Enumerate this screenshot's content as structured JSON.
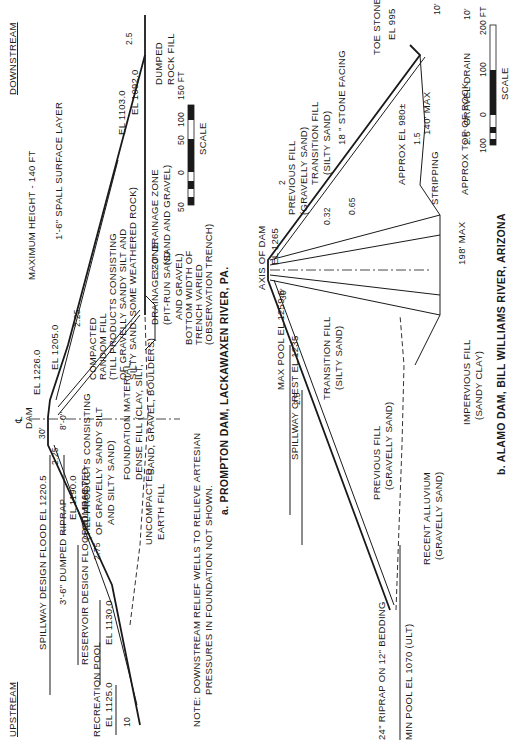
{
  "figure_a": {
    "caption": "a.  PROMPTON DAM, LACKAWAXEN RIVER, PA.",
    "upstream": "UPSTREAM",
    "downstream": "DOWNSTREAM",
    "max_height": "MAXIMUM HEIGHT - 140 FT",
    "axis_symbol": "℄",
    "axis_label": "DAM",
    "crest_width": "30'",
    "crest_el": "EL 1226.0",
    "berm_el": "EL 1205.0",
    "spillway_flood": "SPILLWAY DESIGN FLOOD EL 1220.5",
    "el_1190": "EL 1190.0",
    "riprap": "3'-6\" DUMPED RIPRAP",
    "reservoir_flood": "RESERVOIR DESIGN FLOOD EL 1168.7",
    "el_1130": "EL 1130.0",
    "recreation_pool": "RECREATION POOL",
    "recreation_el": "EL 1125.0",
    "slope_up_1": "2.25",
    "slope_up_2": "2.75",
    "slope_up_3": "10",
    "slope_down": "2.25",
    "slope_toe": "2.5",
    "one": "1",
    "two": "2",
    "core_offset": "8'-0\"",
    "compacted_earth": [
      "COMPACTED",
      "EARTH FILL",
      "(TILL PRODUCTS CONSISTING",
      "OF GRAVELLY SANDY SILT",
      "AND SILTY SAND)"
    ],
    "compacted_random": [
      "COMPACTED",
      "RANDOM FILL",
      "(TILL PRODUCTS CONSISTING",
      "OF GRAVELLY SANDY SILT AND",
      "SILTY SAND:  SOME WEATHERED ROCK)"
    ],
    "spall": "1'-6\" SPALL SURFACE LAYER",
    "el_1103": "EL 1103.0",
    "el_1092": "EL 1092.0",
    "dumped_rock": [
      "DUMPED",
      "ROCK FILL"
    ],
    "drainage_3ft": [
      "3'-0\" DRAINAGE ZONE",
      "(SAND AND GRAVEL)"
    ],
    "drainage_zone": [
      "DRAINAGE ZONE",
      "(PIT-RUN SAND",
      "AND GRAVEL)"
    ],
    "trench": [
      "BOTTOM WIDTH OF",
      "TRENCH VARIED",
      "(OBSERVATION TRENCH)"
    ],
    "uncompacted": [
      "UNCOMPACTED",
      "EARTH FILL"
    ],
    "foundation": [
      "FOUNDATION MATERIAL:",
      "DENSE FILL (CLAY, SILT,",
      "SAND, GRAVEL, BOULDERS)"
    ],
    "note": [
      "NOTE:  DOWNSTREAM RELIEF WELLS TO RELIEVE ARTESIAN",
      "PRESSURES IN FOUNDATION NOT SHOWN."
    ],
    "scale": {
      "label": "SCALE",
      "ticks": [
        "50",
        "0",
        "50",
        "100",
        "150 FT"
      ]
    }
  },
  "figure_b": {
    "caption": "b.  ALAMO DAM, BILL WILLIAMS RIVER, ARIZONA",
    "axis_label": "AXIS OF DAM",
    "crest_el": "EL 1265",
    "crest_width": "30'",
    "max_pool": "MAX POOL EL 1259.6",
    "spillway_crest": "SPILLWAY CREST EL 1235",
    "min_pool": "MIN POOL EL 1070 (ULT)",
    "riprap": "24\" RIPRAP ON 12\" BEDDING",
    "slope_up": "2.5",
    "slope_down": "2",
    "slope_core_1": "0.32",
    "slope_core_2": "0.65",
    "slope_rock": "1.5",
    "one": "1",
    "previous_fill": [
      "PREVIOUS FILL",
      "(GRAVELLY SAND)"
    ],
    "transition_fill": [
      "TRANSITION FILL",
      "(SILTY SAND)"
    ],
    "recent_alluvium": [
      "RECENT ALLUVIUM",
      "(GRAVELLY SAND)"
    ],
    "impervious": [
      "IMPERVIOUS FILL",
      "(SANDY CLAY)"
    ],
    "top_of_rock": "APPROX TOP OF ROCK",
    "approx_el": "APPROX EL 980±",
    "max_198": "198' MAX",
    "max_140": "140' MAX",
    "stripping": "STRIPPING",
    "stone_facing": "18 \" STONE FACING",
    "toe_stone": "TOE STONE",
    "toe_el": "EL 995",
    "ten_ft": "10'",
    "gravel_drain": "2.5' GRAVEL DRAIN",
    "scale": {
      "label": "SCALE",
      "ticks": [
        "100",
        "0",
        "100",
        "200 FT"
      ]
    }
  }
}
